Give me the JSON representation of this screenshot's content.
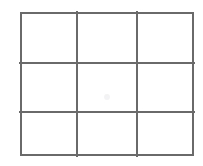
{
  "canvas": {
    "width": 203,
    "height": 166,
    "background_color": "#ffffff"
  },
  "figure": {
    "name": "3x3 grid",
    "rows": 3,
    "columns": 3,
    "line_color": "#6a6a6a",
    "line_width": 1.5,
    "fill_color": "#ffffff",
    "origin_x": 20,
    "origin_y": 12,
    "width": 174,
    "height": 144,
    "vertical_divider_x": [
      57,
      117
    ],
    "horizontal_divider_y": [
      51,
      100
    ],
    "column_widths": [
      57,
      60,
      57
    ],
    "row_heights": [
      51,
      49,
      44
    ]
  },
  "cells": [
    {
      "row": 1,
      "column": 1,
      "label": "",
      "x": 0,
      "y": 0,
      "width": 57,
      "height": 51
    },
    {
      "row": 1,
      "column": 2,
      "label": "",
      "x": 57,
      "y": 0,
      "width": 60,
      "height": 51
    },
    {
      "row": 1,
      "column": 3,
      "label": "",
      "x": 117,
      "y": 0,
      "width": 57,
      "height": 51
    },
    {
      "row": 2,
      "column": 1,
      "label": "",
      "x": 0,
      "y": 51,
      "width": 57,
      "height": 49
    },
    {
      "row": 2,
      "column": 2,
      "label": "",
      "x": 57,
      "y": 51,
      "width": 60,
      "height": 49
    },
    {
      "row": 2,
      "column": 3,
      "label": "",
      "x": 117,
      "y": 51,
      "width": 57,
      "height": 49
    },
    {
      "row": 3,
      "column": 1,
      "label": "",
      "x": 0,
      "y": 100,
      "width": 57,
      "height": 44
    },
    {
      "row": 3,
      "column": 2,
      "label": "",
      "x": 57,
      "y": 100,
      "width": 60,
      "height": 44
    },
    {
      "row": 3,
      "column": 3,
      "label": "",
      "x": 117,
      "y": 100,
      "width": 57,
      "height": 44
    }
  ],
  "artifacts": {
    "center_smudge": {
      "name": "faint-center-mark",
      "x": 104,
      "y": 94,
      "size": 6,
      "color": "#f2f2f4"
    }
  }
}
